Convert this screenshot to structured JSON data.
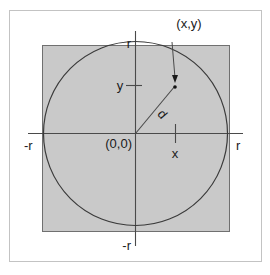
{
  "figure": {
    "background_color": "#ffffff",
    "frame_color": "#c0c0c0",
    "square_fill": "#c9c9c9",
    "square_stroke": "#6e6e6e",
    "circle_stroke": "#3a3a3a",
    "axis_color": "#4a4a4a",
    "label_color": "#1a1a1a"
  },
  "labels": {
    "point": "(x,y)",
    "origin": "(0,0)",
    "radius_top": "r",
    "radius_right": "r",
    "radius_bottom": "-r",
    "radius_left": "-r",
    "y_coord": "y",
    "x_coord": "x",
    "distance": "d"
  },
  "geometry": {
    "center_x": 135,
    "center_y": 133,
    "radius": 92,
    "point_x": 175,
    "point_y": 85,
    "square_left": 42,
    "square_top": 45,
    "square_right": 230,
    "square_bottom": 232,
    "frame_left": 9,
    "frame_top": 10,
    "frame_right": 262,
    "frame_bottom": 262
  }
}
